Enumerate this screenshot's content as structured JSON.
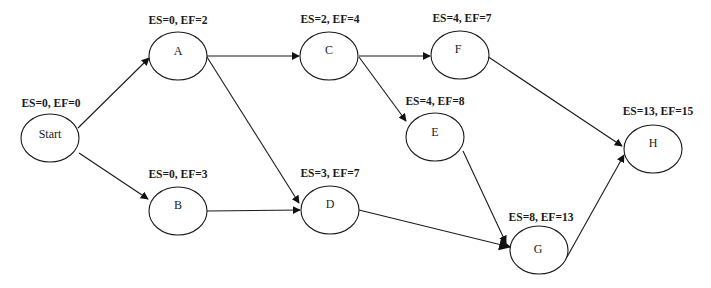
{
  "diagram": {
    "type": "network-diagram",
    "nodes": [
      {
        "id": "start",
        "label": "Start",
        "times": "ES=0, EF=0",
        "cx": 50,
        "cy": 136
      },
      {
        "id": "a",
        "label": "A",
        "times": "ES=0, EF=2",
        "cx": 178,
        "cy": 52
      },
      {
        "id": "b",
        "label": "B",
        "times": "ES=0, EF=3",
        "cx": 178,
        "cy": 211
      },
      {
        "id": "c",
        "label": "C",
        "times": "ES=2, EF=4",
        "cx": 329,
        "cy": 49
      },
      {
        "id": "d",
        "label": "D",
        "times": "ES=3, EF=7",
        "cx": 330,
        "cy": 210
      },
      {
        "id": "e",
        "label": "E",
        "times": "ES=4, EF=8",
        "cx": 435,
        "cy": 137
      },
      {
        "id": "f",
        "label": "F",
        "times": "ES=4, EF=7",
        "cx": 460,
        "cy": 48
      },
      {
        "id": "g",
        "label": "G",
        "times": "ES=8, EF=13",
        "cx": 540,
        "cy": 250
      },
      {
        "id": "h",
        "label": "H",
        "times": "ES=13, EF=15",
        "cx": 652,
        "cy": 149
      }
    ],
    "edges": [
      {
        "from": "Start",
        "to": "A"
      },
      {
        "from": "Start",
        "to": "B"
      },
      {
        "from": "A",
        "to": "C"
      },
      {
        "from": "A",
        "to": "D"
      },
      {
        "from": "B",
        "to": "D"
      },
      {
        "from": "C",
        "to": "F"
      },
      {
        "from": "C",
        "to": "E"
      },
      {
        "from": "F",
        "to": "H"
      },
      {
        "from": "E",
        "to": "G"
      },
      {
        "from": "D",
        "to": "G"
      },
      {
        "from": "G",
        "to": "H"
      }
    ]
  }
}
